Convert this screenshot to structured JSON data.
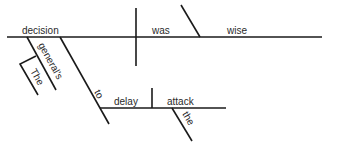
{
  "diagram": {
    "type": "Reed-Kellogg sentence diagram",
    "sentence_words": [
      "The",
      "general's",
      "decision",
      "to",
      "delay",
      "the",
      "attack",
      "was",
      "wise"
    ],
    "subject": "decision",
    "verb": "was",
    "predicate_adjective": "wise",
    "modifiers": {
      "possessive": "general's",
      "article_on_possessive": "The"
    },
    "infinitive_phrase": {
      "preposition": "to",
      "verb": "delay",
      "object": "attack",
      "object_article": "the"
    },
    "colors": {
      "line": "#1a1a1a",
      "text": "#2a2a2a",
      "background": "#ffffff"
    }
  }
}
